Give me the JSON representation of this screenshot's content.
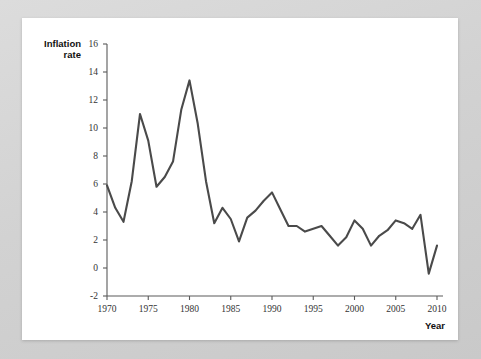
{
  "chart_data": {
    "type": "line",
    "title": "",
    "xlabel": "Year",
    "ylabel": "Inflation rate",
    "ylabel_line1": "Inflation",
    "ylabel_line2": "rate",
    "xlim": [
      1970,
      2010
    ],
    "ylim": [
      -2,
      16
    ],
    "xticks": [
      1970,
      1975,
      1980,
      1985,
      1990,
      1995,
      2000,
      2005,
      2010
    ],
    "yticks": [
      -2,
      0,
      2,
      4,
      6,
      8,
      10,
      12,
      14,
      16
    ],
    "grid": false,
    "legend": null,
    "line_color": "#4a4a4a",
    "axis_color": "#5a5a5a",
    "background": "#ffffff",
    "x": [
      1970,
      1971,
      1972,
      1973,
      1974,
      1975,
      1976,
      1977,
      1978,
      1979,
      1980,
      1981,
      1982,
      1983,
      1984,
      1985,
      1986,
      1987,
      1988,
      1989,
      1990,
      1991,
      1992,
      1993,
      1994,
      1995,
      1996,
      1997,
      1998,
      1999,
      2000,
      2001,
      2002,
      2003,
      2004,
      2005,
      2006,
      2007,
      2008,
      2009,
      2010
    ],
    "values": [
      5.9,
      4.3,
      3.3,
      6.2,
      11.0,
      9.1,
      5.8,
      6.5,
      7.6,
      11.3,
      13.4,
      10.3,
      6.2,
      3.2,
      4.3,
      3.5,
      1.9,
      3.6,
      4.1,
      4.8,
      5.4,
      4.2,
      3.0,
      3.0,
      2.6,
      2.8,
      3.0,
      2.3,
      1.6,
      2.2,
      3.4,
      2.8,
      1.6,
      2.3,
      2.7,
      3.4,
      3.2,
      2.8,
      3.8,
      -0.4,
      1.6
    ],
    "series_name": "Inflation rate"
  }
}
